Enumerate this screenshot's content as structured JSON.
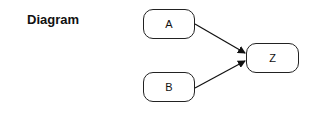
{
  "title": "Diagram",
  "nodes": [
    {
      "id": "A",
      "label": "A"
    },
    {
      "id": "B",
      "label": "B"
    },
    {
      "id": "Z",
      "label": "Z"
    }
  ],
  "edges": [
    {
      "from": "A",
      "to": "Z"
    },
    {
      "from": "B",
      "to": "Z"
    }
  ]
}
